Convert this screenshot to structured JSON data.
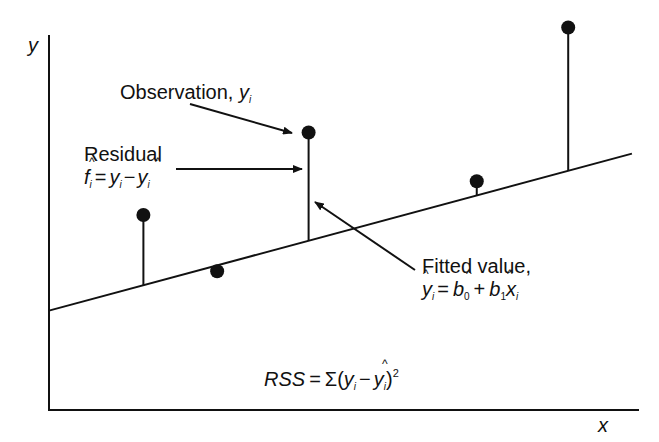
{
  "chart_data": {
    "type": "scatter",
    "title": "",
    "xlabel": "x",
    "ylabel": "y",
    "xlim": [
      0,
      10
    ],
    "ylim": [
      0,
      10
    ],
    "grid": false,
    "regression_line": {
      "intercept": 2.65,
      "slope": 0.4237
    },
    "points": [
      {
        "x": 1.6,
        "y": 5.2
      },
      {
        "x": 2.85,
        "y": 3.7
      },
      {
        "x": 4.4,
        "y": 7.4
      },
      {
        "x": 7.25,
        "y": 6.1
      },
      {
        "x": 8.8,
        "y": 10.2
      }
    ],
    "annotations": {
      "observation": {
        "text": "Observation, ",
        "var": "y",
        "sub": "i"
      },
      "residual": {
        "title": "Residual",
        "formula": [
          "f",
          "i",
          "=",
          "y",
          "i",
          "−",
          "y",
          "i"
        ]
      },
      "fitted": {
        "title": "Fitted value,",
        "formula": [
          "y",
          "i",
          "=",
          "b",
          "0",
          "+",
          "b",
          "1",
          "x",
          "i"
        ]
      },
      "rss": {
        "lhs": "RSS",
        "eq": "=",
        "sigma": "Σ(",
        "y": "y",
        "sub_i": "i",
        "minus": "−",
        "yhat": "y",
        "sup": "2",
        "close": ")"
      }
    }
  }
}
